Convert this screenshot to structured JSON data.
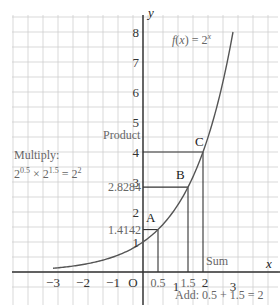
{
  "chart_data": {
    "type": "line",
    "function_label": "f(x) = 2",
    "function_exponent": "x",
    "xlabel": "x",
    "ylabel": "y",
    "xlim": [
      -3.5,
      4
    ],
    "ylim": [
      -0.6,
      8.6
    ],
    "grid": true,
    "grid_minor_step": 0.5,
    "x_ticks": [
      {
        "value": -3,
        "label": "−3"
      },
      {
        "value": -2,
        "label": "−2"
      },
      {
        "value": -1,
        "label": "−1"
      },
      {
        "value": 0,
        "label": "O"
      },
      {
        "value": 0.5,
        "label": "0.5"
      },
      {
        "value": 1,
        "label": "1"
      },
      {
        "value": 1.5,
        "label": "1.5"
      },
      {
        "value": 2,
        "label": "2"
      },
      {
        "value": 3,
        "label": "3"
      }
    ],
    "y_ticks": [
      {
        "value": 1,
        "label": "1"
      },
      {
        "value": 2,
        "label": "2"
      },
      {
        "value": 3,
        "label": "3"
      },
      {
        "value": 4,
        "label": "4"
      },
      {
        "value": 5,
        "label": "5"
      },
      {
        "value": 6,
        "label": "6"
      },
      {
        "value": 7,
        "label": "7"
      },
      {
        "value": 8,
        "label": "8"
      }
    ],
    "y_value_labels": [
      {
        "value": 1.4142,
        "label": "1.4142"
      },
      {
        "value": 2.8284,
        "label": "2.8284"
      }
    ],
    "series": [
      {
        "name": "f(x) = 2^x",
        "x": [
          -3,
          -2.5,
          -2,
          -1.5,
          -1,
          -0.5,
          0,
          0.5,
          1,
          1.5,
          2,
          2.5,
          3
        ],
        "y": [
          0.125,
          0.1768,
          0.25,
          0.3536,
          0.5,
          0.7071,
          1,
          1.4142,
          2,
          2.8284,
          4,
          5.6569,
          8
        ]
      }
    ],
    "points": [
      {
        "name": "A",
        "x": 0.5,
        "y": 1.4142
      },
      {
        "name": "B",
        "x": 1.5,
        "y": 2.8284
      },
      {
        "name": "C",
        "x": 2,
        "y": 4
      }
    ],
    "annotations": {
      "product": "Product",
      "sum": "Sum",
      "multiply_title": "Multiply:",
      "multiply_eq": [
        "2",
        "0.5",
        " × 2",
        "1.5",
        " = 2",
        "2"
      ],
      "add_eq": "Add: 0.5 + 1.5 = 2"
    }
  }
}
